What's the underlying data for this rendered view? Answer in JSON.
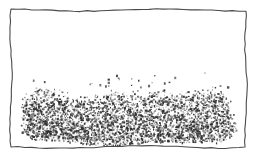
{
  "figure": {
    "title": "Hand-drawn framed sketch of a dense low hedge",
    "kind": "pen-and-ink drawing",
    "canvas": {
      "width": 264,
      "height": 166
    },
    "background_color": "#ffffff"
  },
  "frame": {
    "name": "hand-drawn-rectangle-border",
    "stroke_color": "#4a4a4a",
    "stroke_width": 1.1,
    "style": "wavy freehand single line",
    "bounds": {
      "left": 11,
      "top": 10,
      "right": 246,
      "bottom": 147
    }
  },
  "texture": {
    "name": "foliage-stipple-mass",
    "description": "Dense scribbled stipple mass suggesting a hedge or shrub row occupying the lower portion of the frame",
    "ink_color": "#2b2b2b",
    "light_ink_color": "#8a8a8a",
    "extent": {
      "x_start": 20,
      "x_end": 237,
      "y_top": 84,
      "y_bottom": 142
    },
    "dot_count": 4200,
    "speck_count": 26,
    "top_profile_note": "irregular ragged silhouette, higher near x=60-80 and x=150-170"
  },
  "margins": {
    "outer_background": "#ffffff",
    "left": 11,
    "right": 18,
    "top": 10,
    "bottom": 19
  }
}
